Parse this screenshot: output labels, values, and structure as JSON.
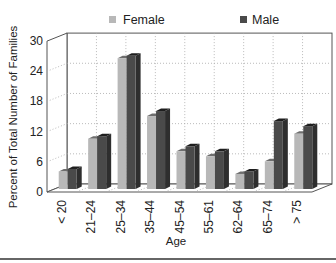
{
  "chart_data": {
    "type": "bar",
    "style": "3d-grouped",
    "title": "",
    "xlabel": "Age",
    "ylabel": "Percent of Total Number of Families",
    "categories": [
      "< 20",
      "21–24",
      "25–34",
      "35–44",
      "45–54",
      "55–61",
      "62–64",
      "65–74",
      "> 75"
    ],
    "series": [
      {
        "name": "Female",
        "color": "#b8b8b8",
        "values": [
          3.5,
          10,
          26,
          14.5,
          7.5,
          6.5,
          3,
          5.5,
          11
        ]
      },
      {
        "name": "Male",
        "color": "#4a4a4a",
        "values": [
          4,
          10.5,
          26.5,
          15.5,
          8.5,
          7.5,
          3.5,
          13.5,
          12.5
        ]
      }
    ],
    "y_ticks": [
      0,
      6,
      12,
      18,
      24,
      30
    ],
    "ylim": [
      0,
      30
    ],
    "grid": true,
    "legend_position": "top"
  },
  "legend": {
    "female_label": "Female",
    "male_label": "Male"
  },
  "axes": {
    "x_label": "Age",
    "y_label": "Percent of Total Number of Families"
  }
}
